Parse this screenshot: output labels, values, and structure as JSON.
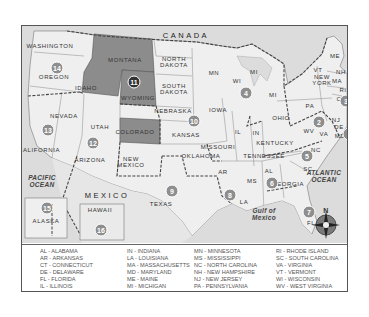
{
  "map": {
    "country_label": "CANADA",
    "mexico_label": "MEXICO",
    "oceans": [
      {
        "id": "pacific",
        "label": "PACIFIC\nOCEAN"
      },
      {
        "id": "atlantic",
        "label": "ATLANTIC\nOCEAN"
      },
      {
        "id": "gulf",
        "label": "Gulf of\nMexico"
      }
    ],
    "highlight_color": "#8c8c8c",
    "land_color": "#efefef",
    "water_color": "#dcdcdc",
    "states": [
      {
        "label": "WASHINGTON",
        "x": 28,
        "y": 20
      },
      {
        "label": "OREGON",
        "x": 32,
        "y": 51
      },
      {
        "label": "IDAHO",
        "x": 64,
        "y": 62
      },
      {
        "label": "MONTANA",
        "x": 103,
        "y": 34
      },
      {
        "label": "WYOMING",
        "x": 116,
        "y": 72
      },
      {
        "label": "NORTH\nDAKOTA",
        "x": 152,
        "y": 36
      },
      {
        "label": "SOUTH\nDAKOTA",
        "x": 152,
        "y": 63
      },
      {
        "label": "NEBRASKA",
        "x": 151,
        "y": 85
      },
      {
        "label": "NEVADA",
        "x": 42,
        "y": 90
      },
      {
        "label": "UTAH",
        "x": 78,
        "y": 101
      },
      {
        "label": "COLORADO",
        "x": 113,
        "y": 106
      },
      {
        "label": "KANSAS",
        "x": 164,
        "y": 109
      },
      {
        "label": "CALIFORNIA",
        "x": 17,
        "y": 124
      },
      {
        "label": "ARIZONA",
        "x": 68,
        "y": 134
      },
      {
        "label": "NEW\nMEXICO",
        "x": 109,
        "y": 136
      },
      {
        "label": "OKLAHOMA",
        "x": 179,
        "y": 130
      },
      {
        "label": "TEXAS",
        "x": 139,
        "y": 178
      },
      {
        "label": "MN",
        "x": 192,
        "y": 47
      },
      {
        "label": "WI",
        "x": 215,
        "y": 55
      },
      {
        "label": "MI",
        "x": 232,
        "y": 46
      },
      {
        "label": "MI",
        "x": 251,
        "y": 69
      },
      {
        "label": "IOWA",
        "x": 196,
        "y": 84
      },
      {
        "label": "IL",
        "x": 216,
        "y": 106
      },
      {
        "label": "IN",
        "x": 234,
        "y": 107
      },
      {
        "label": "OHIO",
        "x": 259,
        "y": 92
      },
      {
        "label": "MISSOURI",
        "x": 196,
        "y": 121
      },
      {
        "label": "KENTUCKY",
        "x": 253,
        "y": 117
      },
      {
        "label": "TENNESSEE",
        "x": 242,
        "y": 130
      },
      {
        "label": "AR",
        "x": 201,
        "y": 146
      },
      {
        "label": "MS",
        "x": 230,
        "y": 155
      },
      {
        "label": "LA",
        "x": 222,
        "y": 176
      },
      {
        "label": "AL",
        "x": 247,
        "y": 145
      },
      {
        "label": "GEORGIA",
        "x": 266,
        "y": 158
      },
      {
        "label": "SC",
        "x": 286,
        "y": 143
      },
      {
        "label": "NC",
        "x": 294,
        "y": 124
      },
      {
        "label": "VA",
        "x": 302,
        "y": 108
      },
      {
        "label": "WV",
        "x": 287,
        "y": 105
      },
      {
        "label": "MD",
        "x": 318,
        "y": 110
      },
      {
        "label": "DE",
        "x": 317,
        "y": 101
      },
      {
        "label": "NJ",
        "x": 314,
        "y": 94
      },
      {
        "label": "PA",
        "x": 288,
        "y": 80
      },
      {
        "label": "NEW\nYORK",
        "x": 300,
        "y": 54
      },
      {
        "label": "CT",
        "x": 319,
        "y": 73
      },
      {
        "label": "RI",
        "x": 321,
        "y": 64
      },
      {
        "label": "MA",
        "x": 315,
        "y": 55
      },
      {
        "label": "VT",
        "x": 296,
        "y": 44
      },
      {
        "label": "NH",
        "x": 319,
        "y": 46
      },
      {
        "label": "ME",
        "x": 313,
        "y": 30
      },
      {
        "label": "FL",
        "x": 289,
        "y": 197
      },
      {
        "label": "ALASKA",
        "x": 24,
        "y": 195
      },
      {
        "label": "HAWAII",
        "x": 78,
        "y": 184
      }
    ],
    "regions": [
      {
        "num": "1",
        "x": 327,
        "y": 108
      },
      {
        "num": "2",
        "x": 297,
        "y": 96
      },
      {
        "num": "3",
        "x": 324,
        "y": 75
      },
      {
        "num": "4",
        "x": 224,
        "y": 67
      },
      {
        "num": "5",
        "x": 285,
        "y": 130
      },
      {
        "num": "6",
        "x": 250,
        "y": 157
      },
      {
        "num": "7",
        "x": 287,
        "y": 186
      },
      {
        "num": "8",
        "x": 208,
        "y": 169
      },
      {
        "num": "9",
        "x": 150,
        "y": 165
      },
      {
        "num": "10",
        "x": 172,
        "y": 95
      },
      {
        "num": "11",
        "x": 112,
        "y": 56,
        "dark": true
      },
      {
        "num": "12",
        "x": 71,
        "y": 117
      },
      {
        "num": "13",
        "x": 26,
        "y": 104
      },
      {
        "num": "14",
        "x": 35,
        "y": 42
      },
      {
        "num": "15",
        "x": 25,
        "y": 182
      },
      {
        "num": "16",
        "x": 79,
        "y": 204
      }
    ],
    "compass": {
      "label": "N"
    }
  },
  "legend": {
    "columns": [
      [
        "AL - ALABAMA",
        "AR - ARKANSAS",
        "CT - CONNECTICUT",
        "DE - DELAWARE",
        "FL - FLORIDA",
        "IL - ILLINOIS"
      ],
      [
        "IN - INDIANA",
        "LA - LOUISIANA",
        "MA - MASSACHUSETTS",
        "MD - MARYLAND",
        "ME - MAINE",
        "MI - MICHIGAN"
      ],
      [
        "MN - MINNESOTA",
        "MS - MISSISSIPPI",
        "NC - NORTH CAROLINA",
        "NH - NEW HAMPSHIRE",
        "NJ - NEW JERSEY",
        "PA - PENNSYLVANIA"
      ],
      [
        "RI - RHODE ISLAND",
        "SC - SOUTH CAROLINA",
        "VA - VIRGINIA",
        "VT - VERMONT",
        "WI - WISCONSIN",
        "WV - WEST VIRGINIA"
      ]
    ]
  }
}
